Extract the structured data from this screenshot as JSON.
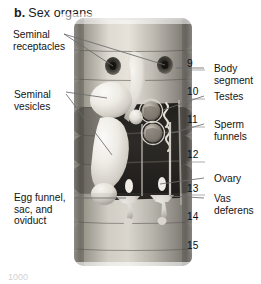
{
  "figure": {
    "panel_letter": "b.",
    "title": "Sex organs",
    "colors": {
      "text": "#141414",
      "leader_line": "#6b6b6b",
      "body_light": "#e8e6e1",
      "body_mid": "#9a968f",
      "body_dark": "#4a4844",
      "cavity_dark": "#2a2824",
      "organ_highlight": "#f2f0ec"
    }
  },
  "labels_left": [
    {
      "name": "seminal-receptacles",
      "text": "Seminal\nreceptacles",
      "x": 13,
      "y": 29
    },
    {
      "name": "seminal-vesicles",
      "text": "Seminal\nvesicles",
      "x": 14,
      "y": 89
    },
    {
      "name": "egg-funnel-sac-oviduct",
      "text": "Egg funnel,\nsac, and\noviduct",
      "x": 14,
      "y": 192
    }
  ],
  "labels_right": [
    {
      "name": "body-segment",
      "text": "Body\nsegment",
      "x": 214,
      "y": 63
    },
    {
      "name": "testes",
      "text": "Testes",
      "x": 214,
      "y": 91
    },
    {
      "name": "sperm-funnels",
      "text": "Sperm\nfunnels",
      "x": 214,
      "y": 119
    },
    {
      "name": "ovary",
      "text": "Ovary",
      "x": 214,
      "y": 173
    },
    {
      "name": "vas-deferens",
      "text": "Vas\ndeferens",
      "x": 214,
      "y": 193
    }
  ],
  "segment_numbers": [
    {
      "value": "9",
      "x": 187,
      "y": 58
    },
    {
      "value": "10",
      "x": 187,
      "y": 86
    },
    {
      "value": "11",
      "x": 187,
      "y": 114
    },
    {
      "value": "12",
      "x": 187,
      "y": 149
    },
    {
      "value": "13",
      "x": 187,
      "y": 183
    },
    {
      "value": "14",
      "x": 187,
      "y": 211
    },
    {
      "value": "15",
      "x": 187,
      "y": 240
    }
  ],
  "bottom_crop_text": "1000"
}
